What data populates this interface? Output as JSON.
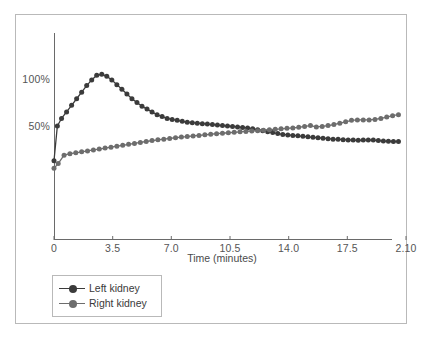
{
  "chart_data": {
    "type": "line",
    "title": "",
    "subtitle": "",
    "xlabel": "Time (minutes)",
    "ylabel": "",
    "grid": false,
    "legend_position": "bottom-left",
    "xlim": [
      0,
      21
    ],
    "ylim": [
      0,
      125
    ],
    "xticks": [
      "0",
      "3.5",
      "7.0",
      "10.5",
      "14.0",
      "17.5",
      "2.10"
    ],
    "xtick_values": [
      0,
      3.5,
      7,
      10.5,
      14,
      17.5,
      21
    ],
    "yticks": [
      "50%",
      "100%"
    ],
    "ytick_values": [
      50,
      100
    ],
    "annotations": [],
    "series": [
      {
        "name": "Left kidney",
        "color": "#3b3b3b",
        "marker": "circle",
        "x": [
          0.0,
          0.2,
          0.45,
          0.75,
          1.05,
          1.35,
          1.65,
          1.95,
          2.25,
          2.55,
          2.85,
          3.15,
          3.45,
          3.75,
          4.05,
          4.35,
          4.65,
          4.95,
          5.25,
          5.55,
          5.85,
          6.15,
          6.45,
          6.75,
          7.05,
          7.35,
          7.65,
          7.95,
          8.25,
          8.55,
          8.85,
          9.15,
          9.45,
          9.75,
          10.05,
          10.35,
          10.65,
          10.95,
          11.25,
          11.55,
          11.85,
          12.15,
          12.45,
          12.75,
          13.05,
          13.35,
          13.65,
          13.95,
          14.25,
          14.55,
          14.85,
          15.15,
          15.45,
          15.75,
          16.05,
          16.35,
          16.65,
          16.95,
          17.25,
          17.55,
          17.85,
          18.15,
          18.45,
          18.75,
          19.05,
          19.35,
          19.65,
          19.95,
          20.25,
          20.55
        ],
        "y": [
          13.0,
          50.0,
          58.0,
          65.0,
          72.0,
          79.0,
          86.0,
          93.0,
          99.0,
          104.0,
          105.0,
          103.0,
          99.0,
          94.0,
          89.0,
          84.0,
          79.0,
          75.0,
          71.0,
          68.0,
          65.0,
          62.0,
          60.0,
          58.0,
          57.0,
          56.0,
          55.0,
          54.0,
          53.5,
          53.0,
          52.5,
          52.0,
          51.5,
          51.0,
          50.5,
          50.0,
          49.5,
          49.0,
          48.5,
          48.0,
          47.0,
          46.0,
          45.0,
          44.0,
          43.0,
          42.0,
          41.0,
          40.5,
          40.0,
          39.5,
          39.0,
          38.5,
          38.0,
          37.5,
          37.0,
          36.5,
          36.0,
          35.8,
          35.5,
          35.2,
          35.0,
          34.8,
          35.0,
          35.2,
          35.0,
          34.5,
          34.0,
          33.8,
          33.5,
          33.5
        ]
      },
      {
        "name": "Right kidney",
        "color": "#6d6d6d",
        "marker": "circle",
        "x": [
          0.0,
          0.25,
          0.6,
          0.95,
          1.3,
          1.65,
          2.0,
          2.35,
          2.7,
          3.05,
          3.4,
          3.75,
          4.1,
          4.45,
          4.8,
          5.15,
          5.5,
          5.85,
          6.2,
          6.55,
          6.9,
          7.25,
          7.6,
          7.95,
          8.3,
          8.65,
          9.0,
          9.35,
          9.7,
          10.05,
          10.4,
          10.75,
          11.1,
          11.45,
          11.8,
          12.15,
          12.5,
          12.85,
          13.2,
          13.55,
          13.9,
          14.25,
          14.6,
          14.95,
          15.3,
          15.65,
          16.0,
          16.35,
          16.7,
          17.05,
          17.4,
          17.75,
          18.1,
          18.45,
          18.8,
          19.15,
          19.5,
          19.85,
          20.2,
          20.55
        ],
        "y": [
          5.0,
          10.0,
          19.0,
          20.5,
          21.5,
          22.5,
          23.5,
          24.5,
          25.5,
          26.5,
          27.5,
          28.5,
          29.5,
          30.5,
          31.5,
          32.5,
          33.5,
          34.5,
          35.3,
          36.0,
          36.8,
          37.5,
          38.2,
          38.8,
          39.4,
          40.0,
          40.6,
          41.2,
          41.8,
          42.3,
          42.8,
          43.3,
          43.8,
          44.2,
          44.6,
          45.0,
          45.5,
          46.0,
          46.5,
          47.0,
          47.5,
          48.0,
          48.6,
          49.5,
          50.5,
          49.0,
          49.5,
          50.5,
          51.5,
          53.0,
          54.5,
          56.0,
          56.5,
          56.5,
          56.5,
          57.0,
          58.0,
          59.5,
          61.0,
          62.0
        ]
      }
    ]
  },
  "legend": {
    "items": [
      {
        "label": "Left kidney"
      },
      {
        "label": "Right kidney"
      }
    ]
  }
}
